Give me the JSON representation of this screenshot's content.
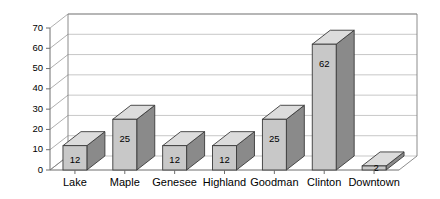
{
  "chart_data": {
    "type": "bar",
    "title": "",
    "subtitle": "",
    "xlabel": "",
    "ylabel": "",
    "categories": [
      "Lake",
      "Maple",
      "Genesee",
      "Highland",
      "Goodman",
      "Clinton",
      "Downtown"
    ],
    "values": [
      12,
      25,
      12,
      12,
      25,
      62,
      2
    ],
    "data_labels": [
      "12",
      "25",
      "12",
      "12",
      "25",
      "62",
      "2"
    ],
    "ylim": [
      0,
      70
    ],
    "ytick_step": 10,
    "ytick_labels": [
      "0",
      "10",
      "20",
      "30",
      "40",
      "50",
      "60",
      "70"
    ],
    "grid": true,
    "legend": false,
    "legend_position": "none",
    "three_d": true,
    "colors": {
      "bar_front": "#c8c8c8",
      "bar_side": "#8a8a8a",
      "bar_top": "#dcdcdc",
      "bar_outline": "#3a3a3a",
      "gridline": "#b9b9b9",
      "frame": "#808080",
      "axis": "#6e6e6e",
      "background": "#ffffff",
      "text": "#000000"
    }
  }
}
